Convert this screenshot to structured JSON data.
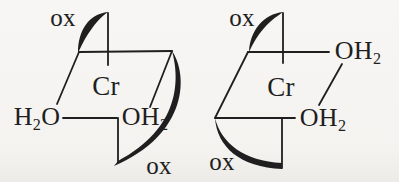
{
  "colors": {
    "ink": "#1f1f1f",
    "background": "#f4f3f0"
  },
  "structures": [
    {
      "id": "left-complex",
      "metal_label": "Cr",
      "oxalate_top_label": "ox",
      "oxalate_bottom_label": "ox",
      "aqua_left": {
        "pre": "H",
        "sub": "2",
        "post": "O"
      },
      "aqua_right": {
        "pre": "OH",
        "sub": "2",
        "post": ""
      }
    },
    {
      "id": "right-complex",
      "metal_label": "Cr",
      "oxalate_top_label": "ox",
      "oxalate_bottom_label": "ox",
      "aqua_top": {
        "pre": "OH",
        "sub": "2",
        "post": ""
      },
      "aqua_bottom": {
        "pre": "OH",
        "sub": "2",
        "post": ""
      }
    }
  ]
}
